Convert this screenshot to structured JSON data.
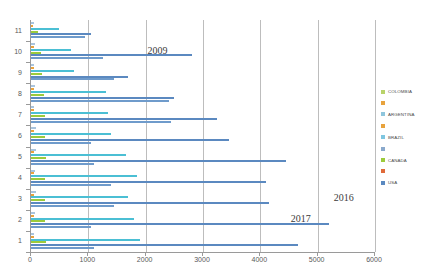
{
  "chart_data": {
    "type": "bar",
    "orientation": "horizontal",
    "title": "",
    "xlabel": "",
    "ylabel": "",
    "xlim": [
      0,
      6000
    ],
    "xticks": [
      0,
      1000,
      2000,
      3000,
      4000,
      5000,
      6000
    ],
    "xtick_labels": [
      "0",
      "1000",
      "2000",
      "3000",
      "4000",
      "5000",
      "6000"
    ],
    "grid": true,
    "grid_axis": "x",
    "legend_position": "right",
    "categories": [
      "1",
      "2",
      "3",
      "4",
      "5",
      "6",
      "7",
      "8",
      "9",
      "10",
      "11"
    ],
    "series": [
      {
        "name": "COLOMBIA",
        "color": "#a9c4dd",
        "values": [
          60,
          70,
          80,
          70,
          90,
          80,
          60,
          70,
          60,
          70,
          60
        ]
      },
      {
        "name": "ARGENTINA",
        "color": "#e8a33d",
        "values": [
          50,
          60,
          60,
          50,
          60,
          50,
          50,
          60,
          50,
          50,
          40
        ]
      },
      {
        "name": "BRAZIL",
        "color": "#4bbfd4",
        "values": [
          1900,
          1800,
          1700,
          1850,
          1650,
          1400,
          1350,
          1300,
          750,
          700,
          480
        ]
      },
      {
        "name": "CANADA",
        "color": "#9ccb3b",
        "values": [
          260,
          250,
          250,
          240,
          260,
          250,
          240,
          230,
          190,
          180,
          120
        ]
      },
      {
        "name": "USA",
        "color": "#5b89c0",
        "values": [
          4650,
          5200,
          4150,
          4100,
          4450,
          3450,
          3250,
          2500,
          1700,
          2800,
          1050
        ]
      },
      {
        "name": "OTHER",
        "color": "#6f9bcb",
        "values": [
          1100,
          1050,
          1450,
          1400,
          1100,
          1050,
          2450,
          2400,
          1450,
          1250,
          950
        ]
      }
    ],
    "annotations": [
      {
        "text": "2009",
        "x": 2050,
        "y_category": "10"
      },
      {
        "text": "2016",
        "x": 5300,
        "y_category": "3"
      },
      {
        "text": "2017",
        "x": 4550,
        "y_category": "2"
      }
    ]
  },
  "legend": {
    "items": [
      {
        "label": "COLOMBIA",
        "color": "#b9d36a"
      },
      {
        "label": "",
        "color": "#e8a33d"
      },
      {
        "label": "ARGENTINA",
        "color": "#8fc6dd"
      },
      {
        "label": "",
        "color": "#e8a33d"
      },
      {
        "label": "BRAZIL",
        "color": "#7fc6e0"
      },
      {
        "label": "",
        "color": "#8aa9cc"
      },
      {
        "label": "CANADA",
        "color": "#9ccb3b"
      },
      {
        "label": "",
        "color": "#e06a3a"
      },
      {
        "label": "USA",
        "color": "#5b89c0"
      }
    ]
  }
}
